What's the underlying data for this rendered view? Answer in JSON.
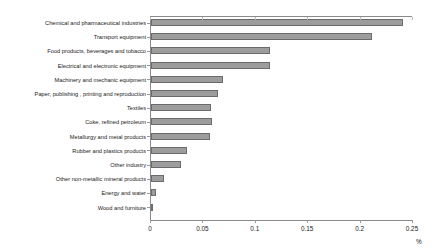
{
  "chart_data": {
    "type": "bar",
    "orientation": "horizontal",
    "title": "",
    "subtitle": "",
    "xlabel": "%",
    "ylabel": "",
    "xlim": [
      0,
      0.25
    ],
    "ylim": null,
    "grid": false,
    "legend": null,
    "legend_position": "none",
    "xticks": [
      0,
      0.05,
      0.1,
      0.15,
      0.2,
      0.25
    ],
    "xtick_labels": [
      "0",
      "0.05",
      "0.1",
      "0.15",
      "0.2",
      "0.25"
    ],
    "categories": [
      "Chemical and pharmaceutical industries",
      "Transport equipment",
      "Food products, beverages and tobacco",
      "Electrical and electronic equipment",
      "Machinery and mechanic equipment",
      "Paper, publishing , printing and reproduction",
      "Textiles",
      "Coke, refined petroleum",
      "Metallurgy and metal products",
      "Rubber and plastics products",
      "Other industry",
      "Other non-metallic mineral products",
      "Energy and water",
      "Wood and furniture"
    ],
    "values": [
      0.2405,
      0.2105,
      0.1135,
      0.1135,
      0.0685,
      0.064,
      0.057,
      0.058,
      0.056,
      0.034,
      0.0285,
      0.0125,
      0.005,
      0.002
    ],
    "bar_color": "#9d9d9d",
    "bar_border_color": "#6b6b6b",
    "axis_color": "#8a8a8a"
  }
}
